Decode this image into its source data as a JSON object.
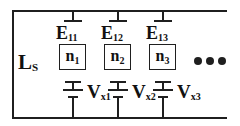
{
  "schematic": {
    "left_label": {
      "main": "L",
      "sub": "S"
    },
    "columns": [
      {
        "top_label": {
          "main": "E",
          "sub": "11"
        },
        "node": {
          "main": "n",
          "sub": "1"
        },
        "source": {
          "main": "V",
          "sub": "x1"
        }
      },
      {
        "top_label": {
          "main": "E",
          "sub": "12"
        },
        "node": {
          "main": "n",
          "sub": "2"
        },
        "source": {
          "main": "V",
          "sub": "x2"
        }
      },
      {
        "top_label": {
          "main": "E",
          "sub": "13"
        },
        "node": {
          "main": "n",
          "sub": "3"
        },
        "source": {
          "main": "V",
          "sub": "x3"
        }
      }
    ],
    "continuation": {
      "symbol": "•••",
      "dot_count": 3
    },
    "colors": {
      "line": "#1f1f1f",
      "background": "#ffffff",
      "text": "#111111"
    }
  }
}
